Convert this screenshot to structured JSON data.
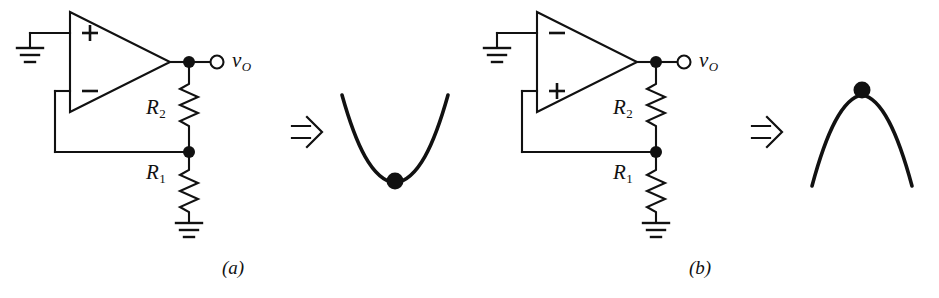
{
  "figure": {
    "type": "circuit-diagram",
    "background_color": "#ffffff",
    "line_color": "#111111",
    "panels": [
      {
        "id": "a",
        "caption": "(a)",
        "caption_x": 233,
        "opamp": {
          "top_terminal_sign": "+",
          "bottom_terminal_sign": "−",
          "top_terminal_connection": "ground",
          "bottom_terminal_connection": "feedback"
        },
        "output_label": "v",
        "output_subscript": "O",
        "resistors": [
          {
            "label": "R",
            "subscript": "2",
            "position": "upper"
          },
          {
            "label": "R",
            "subscript": "1",
            "position": "lower"
          }
        ],
        "implies_symbol": "⇒",
        "analogy": {
          "shape": "valley",
          "stability": "stable",
          "ball_position": "bottom"
        }
      },
      {
        "id": "b",
        "caption": "(b)",
        "caption_x": 700,
        "opamp": {
          "top_terminal_sign": "−",
          "bottom_terminal_sign": "+",
          "top_terminal_connection": "ground",
          "bottom_terminal_connection": "feedback"
        },
        "output_label": "v",
        "output_subscript": "O",
        "resistors": [
          {
            "label": "R",
            "subscript": "2",
            "position": "upper"
          },
          {
            "label": "R",
            "subscript": "1",
            "position": "lower"
          }
        ],
        "implies_symbol": "⇒",
        "analogy": {
          "shape": "hill",
          "stability": "unstable",
          "ball_position": "peak"
        }
      }
    ]
  }
}
